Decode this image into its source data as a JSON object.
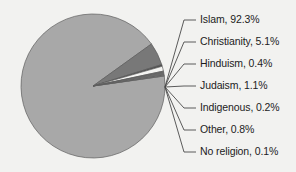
{
  "chart_data": {
    "type": "pie",
    "title": "",
    "subtitle": "",
    "xlabel": "",
    "ylabel": "",
    "legend_position": "right-callout-labels",
    "grid": false,
    "units": "percent",
    "total": 100,
    "categories": [
      "Islam",
      "Christianity",
      "Hinduism",
      "Judaism",
      "Indigenous",
      "Other",
      "No religion"
    ],
    "values": [
      92.3,
      5.1,
      0.4,
      1.1,
      0.2,
      0.8,
      0.1
    ],
    "labels": [
      "Islam, 92.3%",
      "Christianity, 5.1%",
      "Hinduism, 0.4%",
      "Judaism, 1.1%",
      "Indigenous, 0.2%",
      "Other, 0.8%",
      "No religion, 0.1%"
    ],
    "slice_colors": [
      "#a8a8a8",
      "#787878",
      "#4f4f4f",
      "#f4f4f2",
      "#8f8f8f",
      "#6a6a6a",
      "#c9c9c9"
    ],
    "annotations": []
  },
  "figure": {
    "background_color": "#f2f2f0",
    "slice_outline_color": "#5d5d5d",
    "leader_line_color": "#4a4a4a",
    "text_color": "#1c1c1c"
  },
  "pie": {
    "center_x": 93,
    "center_y": 86,
    "radius": 72,
    "start_angle_deg": 352
  },
  "labels_layout": {
    "text_x": 200,
    "ys": [
      20,
      42,
      64,
      86,
      108,
      130,
      152
    ],
    "line_end_x": 196,
    "line_start_x": 184,
    "hub_x": 165,
    "hub_y": 87
  }
}
